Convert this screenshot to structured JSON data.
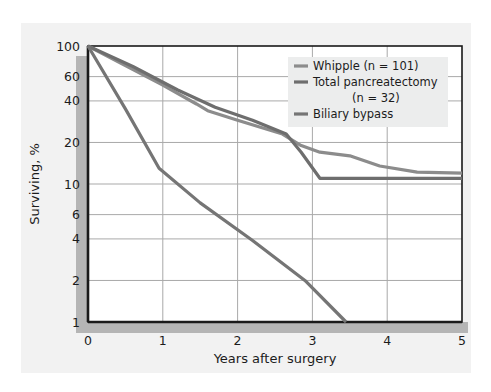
{
  "chart_data": {
    "type": "line",
    "title": "",
    "xlabel": "Years after surgery",
    "ylabel": "Surviving, %",
    "yscale": "log",
    "ylim": [
      1,
      100
    ],
    "xlim": [
      0,
      5
    ],
    "grid": true,
    "legend_position": "upper-right",
    "x_ticks": [
      "0",
      "1",
      "2",
      "3",
      "4",
      "5"
    ],
    "x_tick_values": [
      0,
      1,
      2,
      3,
      4,
      5
    ],
    "y_ticks": [
      "100",
      "60",
      "40",
      "20",
      "10",
      "6",
      "4",
      "2",
      "1"
    ],
    "y_tick_values": [
      100,
      60,
      40,
      20,
      10,
      6,
      4,
      2,
      1
    ],
    "series": [
      {
        "name": "Whipple (n = 101)",
        "color": "#8c8c8c",
        "x": [
          0,
          0.5,
          1.0,
          1.45,
          1.6,
          2.0,
          2.6,
          2.85,
          3.1,
          3.5,
          3.9,
          4.4,
          5.0
        ],
        "y": [
          100,
          72,
          52,
          38,
          34,
          29,
          23,
          19,
          17,
          16,
          13.5,
          12.2,
          12
        ]
      },
      {
        "name": "Total pancreatectomy (n = 32)",
        "color": "#6e6e6e",
        "x": [
          0,
          0.6,
          1.2,
          1.7,
          2.2,
          2.65,
          2.85,
          3.1,
          3.6,
          4.1,
          4.6,
          5.0
        ],
        "y": [
          100,
          71,
          48,
          36,
          29,
          23,
          17,
          11,
          11,
          11,
          11,
          11
        ]
      },
      {
        "name": "Biliary bypass",
        "color": "#757575",
        "x": [
          0,
          0.5,
          0.95,
          1.5,
          2.2,
          2.9,
          3.45
        ],
        "y": [
          100,
          35,
          13,
          7.3,
          3.9,
          2.0,
          1.0
        ]
      }
    ],
    "legend": [
      {
        "label": "Whipple (n = 101)",
        "color": "#8c8c8c"
      },
      {
        "label": "Total pancreatectomy",
        "color": "#6e6e6e"
      },
      {
        "label": "(n = 32)",
        "color": null
      },
      {
        "label": "Biliary bypass",
        "color": "#757575"
      }
    ]
  },
  "colors": {
    "page_background": "#ffffff",
    "panel_background": "#f2f2f2",
    "plot_background": "#ffffff",
    "grid": "#a9a9a9",
    "axis": "#1a1a1a",
    "axis_shadow": "#b5b5b5",
    "legend_background": "#eceded",
    "text": "#1c1c1c"
  }
}
